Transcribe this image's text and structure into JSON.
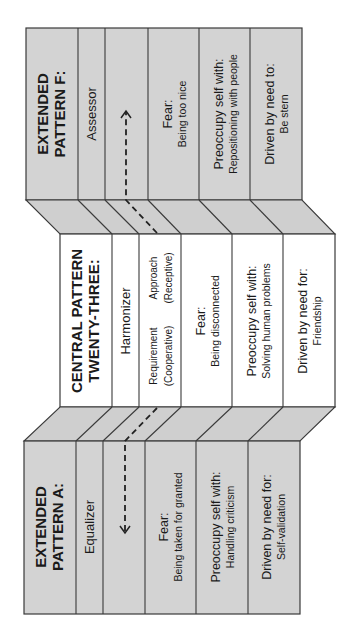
{
  "diagram": {
    "orientation": "rotated-90-ccw",
    "colors": {
      "gray_panel": "#d3d3d3",
      "white_panel": "#ffffff",
      "stroke": "#3a3a3a"
    },
    "panels": {
      "extended_f": {
        "title_line1": "EXTENDED",
        "title_line2": "PATTERN F:",
        "name": "Assessor",
        "fear_label": "Fear:",
        "fear_value": "Being too nice",
        "preoccupy_label": "Preoccupy self with:",
        "preoccupy_value": "Repositioning with people",
        "driven_label": "Driven by need to:",
        "driven_value": "Be stern"
      },
      "central": {
        "title_line1": "CENTRAL PATTERN",
        "title_line2": "TWENTY-THREE:",
        "name": "Harmonizer",
        "requirement_line1": "Requirement",
        "requirement_line2": "(Cooperative)",
        "approach_line1": "Approach",
        "approach_line2": "(Receptive)",
        "fear_label": "Fear:",
        "fear_value": "Being disconnected",
        "preoccupy_label": "Preoccupy self with:",
        "preoccupy_value": "Solving human problems",
        "driven_label": "Driven by need for:",
        "driven_value": "Friendship"
      },
      "extended_a": {
        "title_line1": "EXTENDED",
        "title_line2": "PATTERN A:",
        "name": "Equalizer",
        "fear_label": "Fear:",
        "fear_value": "Being taken for granted",
        "preoccupy_label": "Preoccupy self with:",
        "preoccupy_value": "Handling criticism",
        "driven_label": "Driven by need for:",
        "driven_value": "Self-validation"
      }
    }
  }
}
